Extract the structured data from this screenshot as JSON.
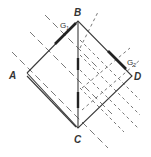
{
  "diagram": {
    "type": "geometric-construction",
    "points": {
      "A": {
        "label": "A",
        "x": 27,
        "y": 73
      },
      "B": {
        "label": "B",
        "x": 78,
        "y": 21
      },
      "C": {
        "label": "C",
        "x": 78,
        "y": 128
      },
      "D": {
        "label": "D",
        "x": 132,
        "y": 76
      }
    },
    "segment_labels": {
      "g1": {
        "text": "G",
        "sub": "1"
      },
      "g2": {
        "text": "G",
        "sub": "2"
      }
    },
    "colors": {
      "line": "#3a3a3a",
      "background": "#ffffff"
    }
  }
}
